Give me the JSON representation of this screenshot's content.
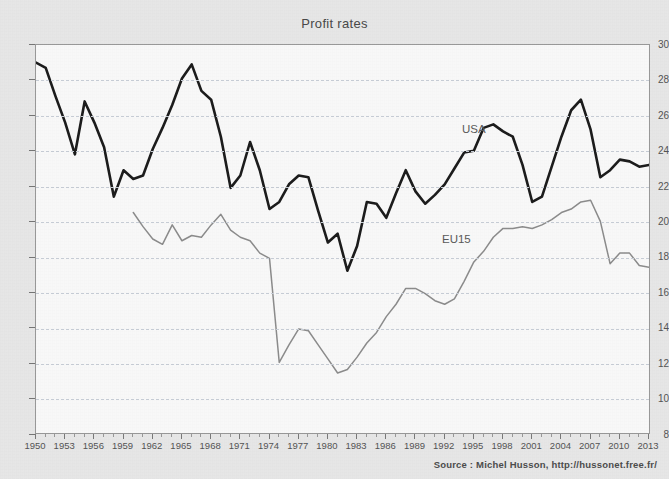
{
  "chart_data": {
    "type": "line",
    "title": "Profit rates",
    "xlabel": "",
    "ylabel": "",
    "xlim": [
      1950,
      2013
    ],
    "ylim": [
      8,
      30
    ],
    "ytick_step": 2,
    "xtick_step": 3,
    "grid": true,
    "legend_position": "inline-annotation",
    "source": "Source : Michel Husson, http://hussonet.free.fr/",
    "ytick_labels": [
      "8",
      "10",
      "12",
      "14",
      "16",
      "18",
      "20",
      "22",
      "24",
      "26",
      "28",
      "30"
    ],
    "xtick_labels": [
      "1950",
      "1953",
      "1956",
      "1959",
      "1962",
      "1965",
      "1968",
      "1971",
      "1974",
      "1977",
      "1980",
      "1983",
      "1986",
      "1989",
      "1992",
      "1995",
      "1998",
      "2001",
      "2004",
      "2007",
      "2010",
      "2013"
    ],
    "series": [
      {
        "name": "USA",
        "color": "#1c1c1c",
        "width": 2.6,
        "x": [
          1950,
          1951,
          1952,
          1953,
          1954,
          1955,
          1956,
          1957,
          1958,
          1959,
          1960,
          1961,
          1962,
          1963,
          1964,
          1965,
          1966,
          1967,
          1968,
          1969,
          1970,
          1971,
          1972,
          1973,
          1974,
          1975,
          1976,
          1977,
          1978,
          1979,
          1980,
          1981,
          1982,
          1983,
          1984,
          1985,
          1986,
          1987,
          1988,
          1989,
          1990,
          1991,
          1992,
          1993,
          1994,
          1995,
          1996,
          1997,
          1998,
          1999,
          2000,
          2001,
          2002,
          2003,
          2004,
          2005,
          2006,
          2007,
          2008,
          2009,
          2010,
          2011,
          2012,
          2013
        ],
        "values": [
          29.0,
          28.7,
          27.1,
          25.6,
          23.8,
          26.8,
          25.6,
          24.2,
          21.4,
          22.9,
          22.4,
          22.6,
          24.1,
          25.3,
          26.6,
          28.1,
          28.9,
          27.4,
          26.9,
          24.8,
          21.9,
          22.6,
          24.5,
          22.9,
          20.7,
          21.1,
          22.1,
          22.6,
          22.5,
          20.6,
          18.8,
          19.3,
          17.2,
          18.6,
          21.1,
          21.0,
          20.2,
          21.6,
          22.9,
          21.7,
          21.0,
          21.5,
          22.1,
          23.0,
          23.9,
          24.0,
          25.3,
          25.5,
          25.1,
          24.8,
          23.2,
          21.1,
          21.4,
          23.1,
          24.8,
          26.3,
          26.9,
          25.2,
          22.5,
          22.9,
          23.5,
          23.4,
          23.1,
          23.2
        ]
      },
      {
        "name": "EU15",
        "color": "#8d8d8d",
        "width": 1.5,
        "x": [
          1960,
          1961,
          1962,
          1963,
          1964,
          1965,
          1966,
          1967,
          1968,
          1969,
          1970,
          1971,
          1972,
          1973,
          1974,
          1975,
          1976,
          1977,
          1978,
          1979,
          1980,
          1981,
          1982,
          1983,
          1984,
          1985,
          1986,
          1987,
          1988,
          1989,
          1990,
          1991,
          1992,
          1993,
          1994,
          1995,
          1996,
          1997,
          1998,
          1999,
          2000,
          2001,
          2002,
          2003,
          2004,
          2005,
          2006,
          2007,
          2008,
          2009,
          2010,
          2011,
          2012,
          2013
        ],
        "values": [
          20.5,
          19.7,
          19.0,
          18.7,
          19.8,
          18.9,
          19.2,
          19.1,
          19.8,
          20.4,
          19.5,
          19.1,
          18.9,
          18.2,
          17.9,
          12.0,
          13.0,
          13.9,
          13.8,
          13.0,
          12.2,
          11.4,
          11.6,
          12.3,
          13.1,
          13.7,
          14.6,
          15.3,
          16.2,
          16.2,
          15.9,
          15.5,
          15.3,
          15.6,
          16.6,
          17.7,
          18.3,
          19.1,
          19.6,
          19.6,
          19.7,
          19.6,
          19.8,
          20.1,
          20.5,
          20.7,
          21.1,
          21.2,
          20.0,
          17.6,
          18.2,
          18.2,
          17.5,
          17.4
        ]
      }
    ],
    "annotations": [
      {
        "text": "USA",
        "x": 1996,
        "y": 24.6
      },
      {
        "text": "EU15",
        "x": 1992,
        "y": 18.4
      }
    ]
  }
}
